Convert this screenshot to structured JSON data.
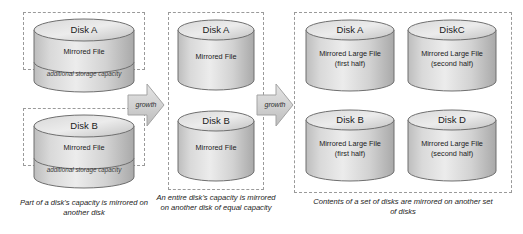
{
  "diagram": {
    "colors": {
      "cylinder_light": "#e2e2e2",
      "cylinder_mid": "#c9c9c9",
      "cylinder_dark": "#a8a8a8",
      "outline": "#6f6f6f",
      "dash_border": "#9a9a9a",
      "arrow_fill": "#d4d4d4",
      "arrow_outline": "#9a9a9a",
      "text": "#1b1b1b"
    },
    "panels": [
      {
        "id": "panel-1",
        "caption": "Part of a disk's capacity is mirrored on another disk",
        "disks": [
          {
            "id": "disk-a",
            "title": "Disk A",
            "band_label": "Mirrored File",
            "extra_label": "additional storage capacity"
          },
          {
            "id": "disk-b",
            "title": "Disk B",
            "band_label": "Mirrored File",
            "extra_label": "additional storage capacity"
          }
        ]
      },
      {
        "id": "panel-2",
        "caption": "An entire disk's capacity is mirrored on another disk of equal capacity",
        "disks": [
          {
            "id": "disk-a",
            "title": "Disk A",
            "band_label": "Mirrored File"
          },
          {
            "id": "disk-b",
            "title": "Disk B",
            "band_label": "Mirrored File"
          }
        ]
      },
      {
        "id": "panel-3",
        "caption": "Contents of a set of disks are mirrored on another set of disks",
        "disks": [
          {
            "id": "disk-a",
            "title": "Disk A",
            "band_label": "Mirrored Large File",
            "band_sub": "(first half)"
          },
          {
            "id": "disk-c",
            "title": "DiskC",
            "band_label": "Mirrored Large File",
            "band_sub": "(second half)"
          },
          {
            "id": "disk-b",
            "title": "Disk B",
            "band_label": "Mirrored Large File",
            "band_sub": "(first half)"
          },
          {
            "id": "disk-d",
            "title": "Disk D",
            "band_label": "Mirrored Large File",
            "band_sub": "(second half)"
          }
        ]
      }
    ],
    "arrows": [
      {
        "id": "growth-arrow-1",
        "label": "growth"
      },
      {
        "id": "growth-arrow-2",
        "label": "growth"
      }
    ]
  }
}
